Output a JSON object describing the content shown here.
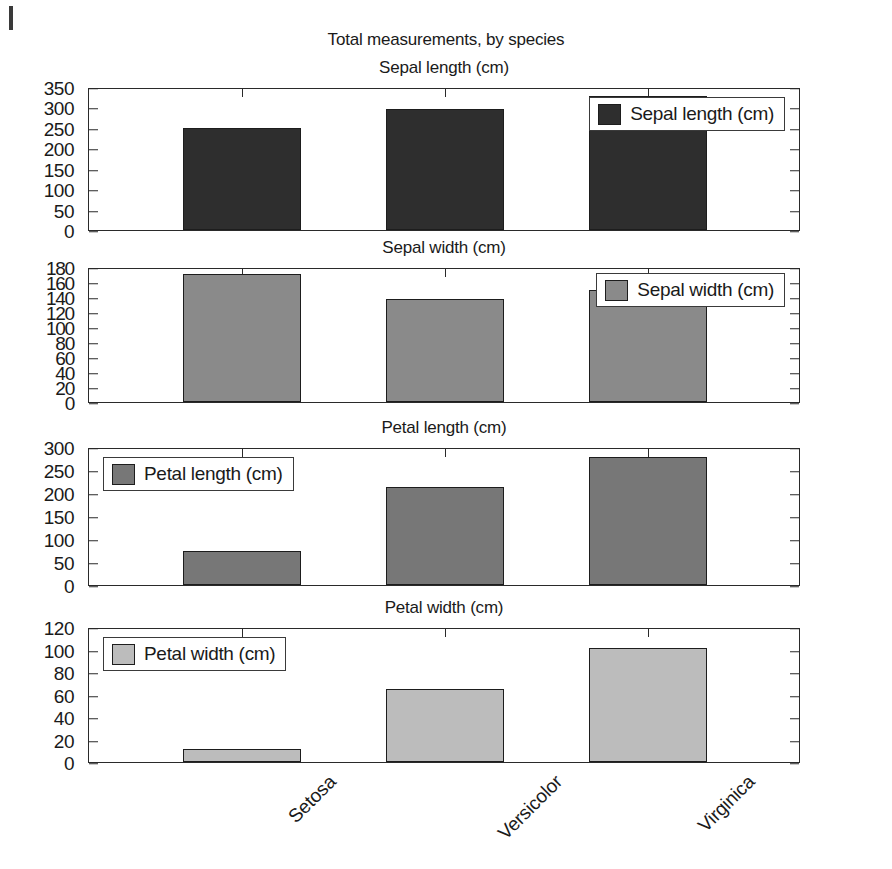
{
  "figure": {
    "suptitle": "Total measurements, by species",
    "background": "#ffffff",
    "axis_color": "#2a2a2a"
  },
  "chart_data": {
    "type": "bar",
    "title": "Total measurements, by species",
    "xlabel": "",
    "ylabel": "",
    "grid": false,
    "categories": [
      "Setosa",
      "Versicolor",
      "Virginica"
    ],
    "layout": "4 stacked subplots sharing the x axis",
    "subplots": [
      {
        "title": "Sepal length (cm)",
        "legend_label": "Sepal length (cm)",
        "legend_position": "top-right",
        "color": "#2e2e2e",
        "categories": [
          "Setosa",
          "Versicolor",
          "Virginica"
        ],
        "values": [
          250,
          297,
          329
        ],
        "ylim": [
          0,
          350
        ],
        "yticks": [
          0,
          50,
          100,
          150,
          200,
          250,
          300,
          350
        ]
      },
      {
        "title": "Sepal width (cm)",
        "legend_label": "Sepal width (cm)",
        "legend_position": "top-right",
        "color": "#8a8a8a",
        "categories": [
          "Setosa",
          "Versicolor",
          "Virginica"
        ],
        "values": [
          171,
          138,
          149
        ],
        "ylim": [
          0,
          180
        ],
        "yticks": [
          0,
          20,
          40,
          60,
          80,
          100,
          120,
          140,
          160,
          180
        ]
      },
      {
        "title": "Petal length (cm)",
        "legend_label": "Petal length (cm)",
        "legend_position": "top-left",
        "color": "#777777",
        "categories": [
          "Setosa",
          "Versicolor",
          "Virginica"
        ],
        "values": [
          73,
          213,
          278
        ],
        "ylim": [
          0,
          300
        ],
        "yticks": [
          0,
          50,
          100,
          150,
          200,
          250,
          300
        ]
      },
      {
        "title": "Petal width (cm)",
        "legend_label": "Petal width (cm)",
        "legend_position": "top-left",
        "color": "#bcbcbc",
        "categories": [
          "Setosa",
          "Versicolor",
          "Virginica"
        ],
        "values": [
          12,
          65,
          101
        ],
        "ylim": [
          0,
          120
        ],
        "yticks": [
          0,
          20,
          40,
          60,
          80,
          100,
          120
        ]
      }
    ]
  }
}
